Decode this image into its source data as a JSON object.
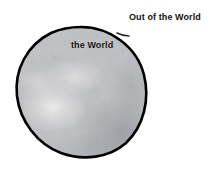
{
  "canvas": {
    "width": 210,
    "height": 174,
    "background_color": "#ffffff"
  },
  "diagram": {
    "title_label": "Out of the World",
    "inner_label": "the World",
    "sphere": {
      "name": "the World",
      "outline_color": "#000000",
      "outline_width": 2.5,
      "fill_light_color": "#d8d8d8",
      "fill_mid_color": "#c0c0c2",
      "fill_dark_color": "#9fa1a7",
      "center_x": 81,
      "center_y": 92,
      "diameter": 134,
      "texture": "cloudy-grayscale"
    },
    "regions": [
      {
        "id": "inside",
        "label": "the World"
      },
      {
        "id": "outside",
        "label": "Out of the World"
      }
    ],
    "rim_mark": {
      "x": 120,
      "y": 35,
      "color": "#2a2a2a"
    }
  }
}
